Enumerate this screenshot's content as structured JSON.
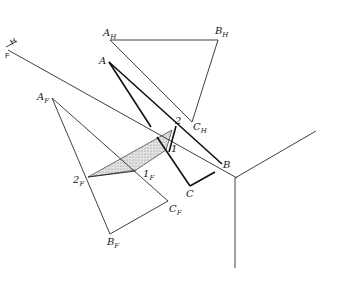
{
  "diagram": {
    "type": "descriptive-geometry-auxiliary-view",
    "fold_line": {
      "label_top": "H",
      "label_bottom": "F",
      "from": [
        8,
        50
      ],
      "to": [
        237,
        178
      ]
    },
    "labels": {
      "A_H": {
        "main": "A",
        "sub": "H",
        "x": 103,
        "y": 36
      },
      "B_H": {
        "main": "B",
        "sub": "H",
        "x": 215,
        "y": 34
      },
      "C_H": {
        "main": "C",
        "sub": "H",
        "x": 192,
        "y": 130
      },
      "A": {
        "main": "A",
        "sub": "",
        "x": 99,
        "y": 64
      },
      "A_F": {
        "main": "A",
        "sub": "F",
        "x": 37,
        "y": 100
      },
      "B_F": {
        "main": "B",
        "sub": "F",
        "x": 107,
        "y": 245
      },
      "C_F": {
        "main": "C",
        "sub": "F",
        "x": 168,
        "y": 212
      },
      "two_F": {
        "main": "2",
        "sub": "F",
        "x": 73,
        "y": 183
      },
      "one_F": {
        "main": "1",
        "sub": "F",
        "x": 143,
        "y": 176
      },
      "two": {
        "main": "2",
        "sub": "",
        "x": 175,
        "y": 124
      },
      "one": {
        "main": "1",
        "sub": "",
        "x": 171,
        "y": 152
      },
      "B": {
        "main": "B",
        "sub": "",
        "x": 223,
        "y": 168
      },
      "C": {
        "main": "C",
        "sub": "",
        "x": 186,
        "y": 197
      }
    },
    "points": {
      "A_H": [
        110,
        40
      ],
      "B_H": [
        218,
        40
      ],
      "C_H": [
        192,
        122
      ],
      "A": [
        109,
        62
      ],
      "B": [
        222,
        164
      ],
      "C": [
        190,
        186
      ],
      "A_F": [
        52,
        98
      ],
      "B_F": [
        110,
        234
      ],
      "C_F": [
        168,
        201
      ],
      "two_F": [
        88,
        177
      ],
      "one_F": [
        136,
        171
      ],
      "two": [
        176,
        126
      ],
      "one": [
        169,
        152
      ],
      "junction": [
        235,
        178
      ],
      "axis_right": [
        316,
        131
      ],
      "axis_down": [
        235,
        268
      ]
    },
    "shaded_region": {
      "fill": "#d4d4d4",
      "polygon": [
        [
          88,
          177
        ],
        [
          172,
          130
        ],
        [
          166,
          150
        ],
        [
          136,
          170
        ]
      ]
    },
    "colors": {
      "line": "#1a1a1a",
      "background": "#ffffff",
      "shade": "#d4d4d4"
    }
  }
}
